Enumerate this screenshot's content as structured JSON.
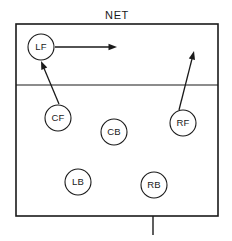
{
  "diagram": {
    "net_label": "NET",
    "background_color": "#ffffff",
    "line_color": "#1a1a1a",
    "circle_fill": "#ffffff"
  },
  "court": {
    "name": "volleyball-court",
    "left": 16,
    "top": 24,
    "right": 218,
    "bottom": 216,
    "attack_line_y": 85,
    "border_width": 1.6,
    "attack_line_width": 1.2,
    "serve_tick": {
      "name": "center-mark",
      "x": 153,
      "y_start": 216,
      "y_end": 235,
      "width": 1.4
    }
  },
  "players": [
    {
      "id": "LF",
      "label": "LF",
      "name": "player-left-front",
      "cx": 41,
      "cy": 47,
      "r": 13
    },
    {
      "id": "CF",
      "label": "CF",
      "name": "player-center-front",
      "cx": 58,
      "cy": 118,
      "r": 13
    },
    {
      "id": "RF",
      "label": "RF",
      "name": "player-right-front",
      "cx": 183,
      "cy": 123,
      "r": 13
    },
    {
      "id": "CB",
      "label": "CB",
      "name": "player-center-back",
      "cx": 114,
      "cy": 132,
      "r": 13
    },
    {
      "id": "LB",
      "label": "LB",
      "name": "player-left-back",
      "cx": 78,
      "cy": 182,
      "r": 13
    },
    {
      "id": "RB",
      "label": "RB",
      "name": "player-right-back",
      "cx": 154,
      "cy": 185,
      "r": 13
    }
  ],
  "arrows": [
    {
      "id": "lf-move",
      "name": "arrow-lf-to-right",
      "from": "LF",
      "x1": 55,
      "y1": 47,
      "x2": 117,
      "y2": 47,
      "description": "LF moves right along the net"
    },
    {
      "id": "cf-move",
      "name": "arrow-cf-to-lf",
      "from": "CF",
      "x1": 59,
      "y1": 104,
      "x2": 41,
      "y2": 61,
      "description": "CF moves up-left toward LF position"
    },
    {
      "id": "rf-move",
      "name": "arrow-rf-to-net",
      "from": "RF",
      "x1": 179,
      "y1": 110,
      "x2": 194,
      "y2": 51,
      "description": "RF moves up toward the net"
    }
  ],
  "net": {
    "label_x": 117,
    "label_y": 15
  }
}
